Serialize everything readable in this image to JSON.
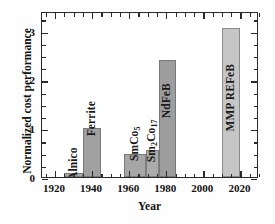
{
  "chart_data": {
    "type": "bar",
    "title": "",
    "xlabel": "Year",
    "ylabel": "Normalized cost performance",
    "xlim": [
      1913,
      2030
    ],
    "ylim": [
      0,
      3.4
    ],
    "grid": false,
    "legend": null,
    "xticks": [
      1920,
      1940,
      1960,
      1980,
      2000,
      2020
    ],
    "xticklabels": [
      "1920",
      "1940",
      "1960",
      "1980",
      "2000",
      "2020"
    ],
    "yticks": [
      0,
      1,
      2,
      3
    ],
    "yticklabels": [
      "0",
      "1",
      "2",
      "3"
    ],
    "xminor_step": 5,
    "yminor_step": 0.25,
    "categories": [
      "Alnico",
      "Ferrite",
      "SmCo5",
      "Sm2Co17",
      "NdFeB",
      "MMP REFeB"
    ],
    "values": [
      0.08,
      1.0,
      0.48,
      0.55,
      2.4,
      3.05
    ],
    "x": [
      1930,
      1940,
      1963,
      1972,
      1981,
      2015
    ],
    "bars": [
      {
        "label": "Alnico",
        "label_html": "Alnico",
        "x_center": 1930,
        "x_start": 1925,
        "x_end": 1935,
        "value": 0.08,
        "color": "#a8a8a8"
      },
      {
        "label": "Ferrite",
        "label_html": "Ferrite",
        "x_center": 1940,
        "x_start": 1935,
        "x_end": 1945,
        "value": 1.0,
        "color": "#a0a0a0"
      },
      {
        "label": "SmCo5",
        "label_html": "SmCo<sub>5</sub>",
        "x_center": 1963,
        "x_start": 1957,
        "x_end": 1969,
        "value": 0.48,
        "color": "#a6a6a6"
      },
      {
        "label": "Sm2Co17",
        "label_html": "Sm<sub>2</sub>Co<sub>17</sub>",
        "x_center": 1972,
        "x_start": 1969,
        "x_end": 1976,
        "value": 0.55,
        "color": "#ababab"
      },
      {
        "label": "NdFeB",
        "label_html": "NdFeB",
        "x_center": 1980,
        "x_start": 1976,
        "x_end": 1985,
        "value": 2.4,
        "color": "#9d9d9d"
      },
      {
        "label": "MMP REFeB",
        "label_html": "MMP REFeB",
        "x_center": 2015,
        "x_start": 2010,
        "x_end": 2020,
        "value": 3.05,
        "color": "#c6c6c6"
      }
    ],
    "colors": {
      "axis": "#2a2a2a",
      "text": "#111111",
      "background": "#ffffff",
      "bar_default": "#a0a0a0",
      "bar_highlight": "#c6c6c6"
    }
  }
}
